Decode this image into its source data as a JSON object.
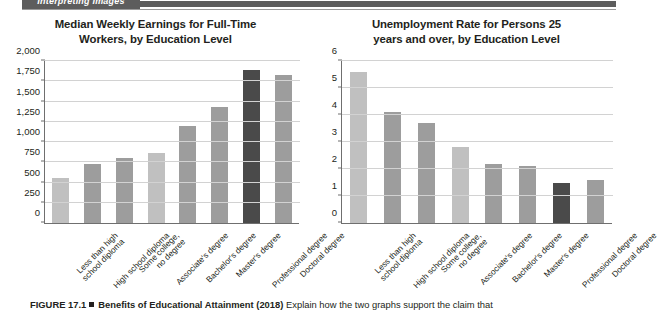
{
  "banner": {
    "section_label": "Interpreting Images"
  },
  "charts": [
    {
      "panel_name": "earnings-chart",
      "title": "Median Weekly Earnings for Full-Time Workers, by Education Level",
      "title_line1": "Median Weekly Earnings for Full-Time",
      "title_line2": "Workers, by Education Level"
    },
    {
      "panel_name": "unemployment-chart",
      "title": "Unemployment Rate for Persons 25 years and over, by Education Level",
      "title_line1": "Unemployment Rate for Persons 25",
      "title_line2": "years and over, by Education Level"
    }
  ],
  "caption": {
    "figure_number": "FIGURE 17.1",
    "figure_title": "Benefits of Educational Attainment (2018)",
    "figure_prompt": "Explain how the two graphs support the claim that"
  },
  "colors": {
    "bar_light": "#c0c0c0",
    "bar_mid": "#9d9d9d",
    "bar_dark": "#4a4a4a",
    "axis": "#6f6f6f",
    "grid": "#d2d2d2",
    "banner": "#5d5d5d",
    "text": "#231f20"
  },
  "chart_data": [
    {
      "type": "bar",
      "title": "Median Weekly Earnings for Full-Time Workers, by Education Level",
      "xlabel": "",
      "ylabel": "",
      "ylim": [
        0,
        2000
      ],
      "yticks": [
        0,
        250,
        500,
        750,
        1000,
        1250,
        1500,
        1750,
        2000
      ],
      "ytick_labels": [
        "0",
        "250",
        "500",
        "750",
        "1,000",
        "1,250",
        "1,500",
        "1,750",
        "2,000"
      ],
      "grid": true,
      "legend": "none",
      "categories": [
        "Less than high school diploma",
        "High school diploma",
        "Some college, no degree",
        "Associate's degree",
        "Bachelor's degree",
        "Master's degree",
        "Professional degree",
        "Doctoral degree"
      ],
      "category_lines": [
        [
          "Less than high",
          "school diploma"
        ],
        [
          "High school diploma"
        ],
        [
          "Some college,",
          "no degree"
        ],
        [
          "Associate's degree"
        ],
        [
          "Bachelor's degree"
        ],
        [
          "Master's degree"
        ],
        [
          "Professional degree"
        ],
        [
          "Doctoral degree"
        ]
      ],
      "values": [
        553,
        730,
        802,
        862,
        1198,
        1434,
        1884,
        1825
      ],
      "bar_shades": [
        "light",
        "mid",
        "mid",
        "light",
        "mid",
        "mid",
        "dark",
        "mid"
      ]
    },
    {
      "type": "bar",
      "title": "Unemployment Rate for Persons 25 years and over, by Education Level",
      "xlabel": "",
      "ylabel": "",
      "ylim": [
        0,
        6
      ],
      "yticks": [
        0,
        1,
        2,
        3,
        4,
        5,
        6
      ],
      "ytick_labels": [
        "0",
        "1",
        "2",
        "3",
        "4",
        "5",
        "6"
      ],
      "grid": true,
      "legend": "none",
      "categories": [
        "Less than high school diploma",
        "High school diploma",
        "Some college, no degree",
        "Associate's degree",
        "Bachelor's degree",
        "Master's degree",
        "Professional degree",
        "Doctoral degree"
      ],
      "category_lines": [
        [
          "Less than high",
          "school diploma"
        ],
        [
          "High school diploma"
        ],
        [
          "Some college,",
          "no degree"
        ],
        [
          "Associate's degree"
        ],
        [
          "Bachelor's degree"
        ],
        [
          "Master's degree"
        ],
        [
          "Professional degree"
        ],
        [
          "Doctoral degree"
        ]
      ],
      "values": [
        5.6,
        4.1,
        3.7,
        2.8,
        2.2,
        2.1,
        1.5,
        1.6
      ],
      "bar_shades": [
        "light",
        "mid",
        "mid",
        "light",
        "mid",
        "mid",
        "dark",
        "mid"
      ]
    }
  ]
}
